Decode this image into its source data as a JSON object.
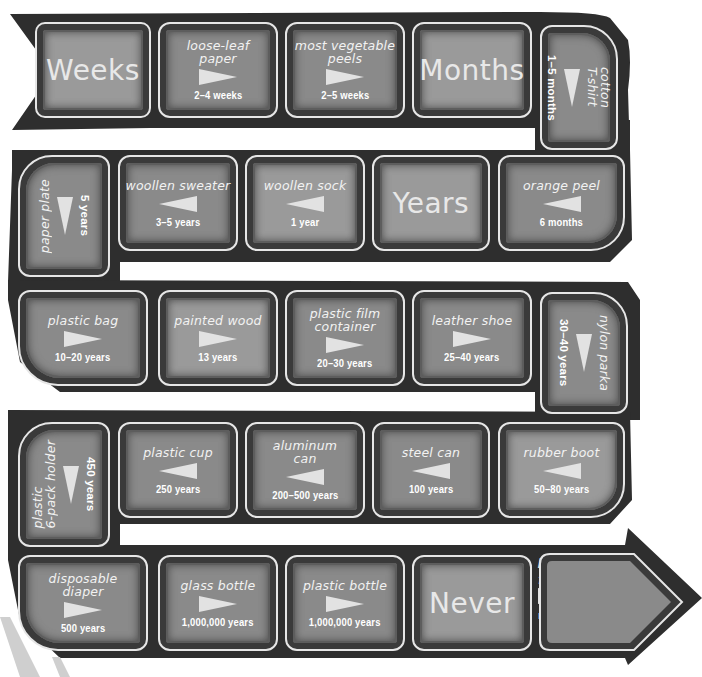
{
  "colors": {
    "path": "#2e2e2e",
    "tile_border": "#e6e6e6",
    "tile_fill": "#8a8a8a",
    "text": "#f2f2f2",
    "arrow": "#e2e2e2",
    "background": "#ffffff"
  },
  "rows": [
    {
      "direction": "right",
      "tiles": [
        {
          "type": "header",
          "label": "Weeks"
        },
        {
          "type": "item",
          "item": "loose-leaf paper",
          "item_lines": [
            "loose-leaf",
            "paper"
          ],
          "duration": "2–4 weeks",
          "arrow": "right"
        },
        {
          "type": "item",
          "item": "most vegetable peels",
          "item_lines": [
            "most vegetable",
            "peels"
          ],
          "duration": "2–5 weeks",
          "arrow": "right"
        },
        {
          "type": "header",
          "label": "Months"
        },
        {
          "type": "item",
          "item": "cotton T-shirt",
          "item_lines": [
            "cotton",
            "T-shirt"
          ],
          "duration": "1–5 months",
          "arrow": "down",
          "orientation": "vertical"
        }
      ]
    },
    {
      "direction": "left",
      "tiles": [
        {
          "type": "item",
          "item": "paper plate",
          "item_lines": [
            "paper plate"
          ],
          "duration": "5 years",
          "arrow": "down",
          "orientation": "vertical"
        },
        {
          "type": "item",
          "item": "woollen sweater",
          "item_lines": [
            "woollen sweater"
          ],
          "duration": "3–5 years",
          "arrow": "left"
        },
        {
          "type": "item",
          "item": "woollen sock",
          "item_lines": [
            "woollen sock"
          ],
          "duration": "1 year",
          "arrow": "left"
        },
        {
          "type": "header",
          "label": "Years"
        },
        {
          "type": "item",
          "item": "orange peel",
          "item_lines": [
            "orange peel"
          ],
          "duration": "6 months",
          "arrow": "left"
        }
      ]
    },
    {
      "direction": "right",
      "tiles": [
        {
          "type": "item",
          "item": "plastic bag",
          "item_lines": [
            "plastic bag"
          ],
          "duration": "10–20 years",
          "arrow": "right"
        },
        {
          "type": "item",
          "item": "painted wood",
          "item_lines": [
            "painted wood"
          ],
          "duration": "13 years",
          "arrow": "right"
        },
        {
          "type": "item",
          "item": "plastic film container",
          "item_lines": [
            "plastic film",
            "container"
          ],
          "duration": "20–30 years",
          "arrow": "right"
        },
        {
          "type": "item",
          "item": "leather shoe",
          "item_lines": [
            "leather shoe"
          ],
          "duration": "25–40 years",
          "arrow": "right"
        },
        {
          "type": "item",
          "item": "nylon parka",
          "item_lines": [
            "nylon parka"
          ],
          "duration": "30–40 years",
          "arrow": "down",
          "orientation": "vertical"
        }
      ]
    },
    {
      "direction": "left",
      "tiles": [
        {
          "type": "item",
          "item": "plastic 6-pack holder",
          "item_lines": [
            "plastic",
            "6-pack holder"
          ],
          "duration": "450 years",
          "arrow": "down",
          "orientation": "vertical"
        },
        {
          "type": "item",
          "item": "plastic cup",
          "item_lines": [
            "plastic cup"
          ],
          "duration": "250 years",
          "arrow": "left"
        },
        {
          "type": "item",
          "item": "aluminum can",
          "item_lines": [
            "aluminum",
            "can"
          ],
          "duration": "200–500 years",
          "arrow": "left"
        },
        {
          "type": "item",
          "item": "steel can",
          "item_lines": [
            "steel can"
          ],
          "duration": "100 years",
          "arrow": "left"
        },
        {
          "type": "item",
          "item": "rubber boot",
          "item_lines": [
            "rubber boot"
          ],
          "duration": "50–80 years",
          "arrow": "left"
        }
      ]
    },
    {
      "direction": "right",
      "tiles": [
        {
          "type": "item",
          "item": "disposable diaper",
          "item_lines": [
            "disposable",
            "diaper"
          ],
          "duration": "500 years",
          "arrow": "right"
        },
        {
          "type": "item",
          "item": "glass bottle",
          "item_lines": [
            "glass bottle"
          ],
          "duration": "1,000,000 years",
          "arrow": "right"
        },
        {
          "type": "item",
          "item": "plastic bottle",
          "item_lines": [
            "plastic bottle"
          ],
          "duration": "1,000,000 years",
          "arrow": "right"
        },
        {
          "type": "header",
          "label": "Never"
        },
        {
          "type": "item",
          "item": "polystyrene foam cup",
          "item_lines": [
            "polystyrene",
            "foam cup"
          ],
          "duration": "never",
          "arrow": "right"
        }
      ]
    }
  ]
}
